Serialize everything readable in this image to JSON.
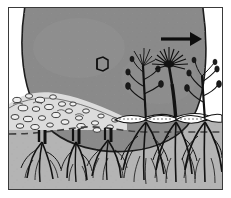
{
  "figure": {
    "caption": "",
    "border_color": "#3a3a3a",
    "background": "#ffffff"
  },
  "colors": {
    "ice_mass": "#8a8a8a",
    "ice_outline": "#1c1c1c",
    "soil": "#b4b4b4",
    "soil_deep": "#b0b0b0",
    "sky": "#ffffff",
    "debris_light": "#f2f2f2",
    "debris_mid": "#c8c8c8",
    "ink": "#111111",
    "dashed_line": "#4a4a4a"
  },
  "elements": {
    "ice_mass": {
      "name": "ice-mass",
      "label": "",
      "fill": "#8a8a8a",
      "shape": "large rounded lobe spanning top of frame"
    },
    "direction_arrow": {
      "name": "direction-arrow",
      "label": "",
      "direction": "right",
      "x": 170,
      "y": 38,
      "length": 36
    },
    "crystal_symbol": {
      "name": "hexagonal-crystal-symbol",
      "label": "",
      "sides": 6,
      "x": 92,
      "y": 57
    },
    "debris_field": {
      "name": "glacial-debris-field",
      "label": "",
      "clast_count": 34
    },
    "soil_surface": {
      "name": "soil-surface-line",
      "label": ""
    },
    "dashed_subsurface": {
      "name": "dashed-subsurface-line",
      "label": "",
      "dash": "7 5"
    }
  },
  "plants": {
    "sheared_label": "",
    "intact_label": "",
    "sheared_root_stumps": [
      {
        "name": "root-stump-1",
        "x": 36
      },
      {
        "name": "root-stump-2",
        "x": 68
      },
      {
        "name": "root-stump-3",
        "x": 100
      }
    ],
    "intact_plants": [
      {
        "name": "intact-plant-1",
        "x": 134,
        "type": "branching-forb",
        "has_flower": true
      },
      {
        "name": "intact-plant-2",
        "x": 167,
        "type": "rosette-forb",
        "has_flower": true
      },
      {
        "name": "intact-plant-3",
        "x": 196,
        "type": "branching-forb",
        "has_flower": false
      }
    ]
  }
}
